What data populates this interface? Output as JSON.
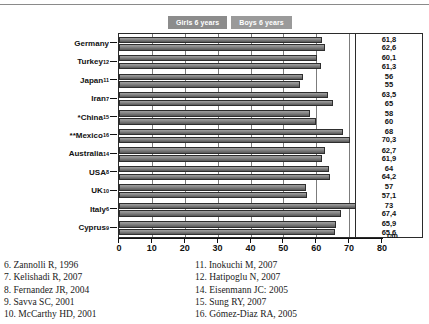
{
  "chart_data": {
    "type": "bar",
    "orientation": "horizontal",
    "title": "",
    "xlabel": "cm",
    "ylabel": "",
    "xlim": [
      0,
      80
    ],
    "xticks": [
      0,
      10,
      20,
      30,
      40,
      50,
      60,
      70,
      80
    ],
    "grid": true,
    "legend_position": "top",
    "unit": "cm",
    "legend": [
      {
        "label": "Girls 6 years",
        "color": "#8c8c8c"
      },
      {
        "label": "Boys 6 years",
        "color": "#9a9a9a"
      }
    ],
    "categories": [
      "Germany",
      "Turkey",
      "Japan",
      "Iran",
      "*China",
      "**Mexico",
      "Australia",
      "USA",
      "UK",
      "Italy",
      "Cyprus"
    ],
    "category_marks": [
      "",
      "",
      "",
      "",
      "*",
      "**",
      "",
      "",
      "",
      "",
      ""
    ],
    "category_refs": [
      "",
      "12",
      "11",
      "7",
      "15",
      "16",
      "14",
      "8",
      "10",
      "6",
      "9"
    ],
    "series": [
      {
        "name": "Girls 6 years",
        "values": [
          61.8,
          60.1,
          56,
          63.5,
          58,
          68,
          62.7,
          64,
          57,
          73,
          65.9
        ],
        "labels": [
          "61,8",
          "60,1",
          "56",
          "63,5",
          "58",
          "68",
          "62,7",
          "64",
          "57",
          "73",
          "65,9"
        ]
      },
      {
        "name": "Boys 6 years",
        "values": [
          62.6,
          61.3,
          55,
          65,
          60,
          70.3,
          61.9,
          64.2,
          57.1,
          67.4,
          65.6
        ],
        "labels": [
          "62,6",
          "61,3",
          "55",
          "65",
          "60",
          "70,3",
          "61,9",
          "64,2",
          "57,1",
          "67,4",
          "65,6"
        ]
      }
    ]
  },
  "references": {
    "left_column": [
      "6. Zannolli R, 1996",
      "7. Kelishadi R, 2007",
      "8. Fernandez JR, 2004",
      "9. Savva SC, 2001",
      "10. McCarthy HD, 2001"
    ],
    "right_column": [
      "11. Inokuchi M, 2007",
      "12. Hatipoglu N, 2007",
      "14. Eisenmann JC: 2005",
      "15. Sung RY, 2007",
      "16. Gómez-Diaz RA, 2005"
    ]
  }
}
